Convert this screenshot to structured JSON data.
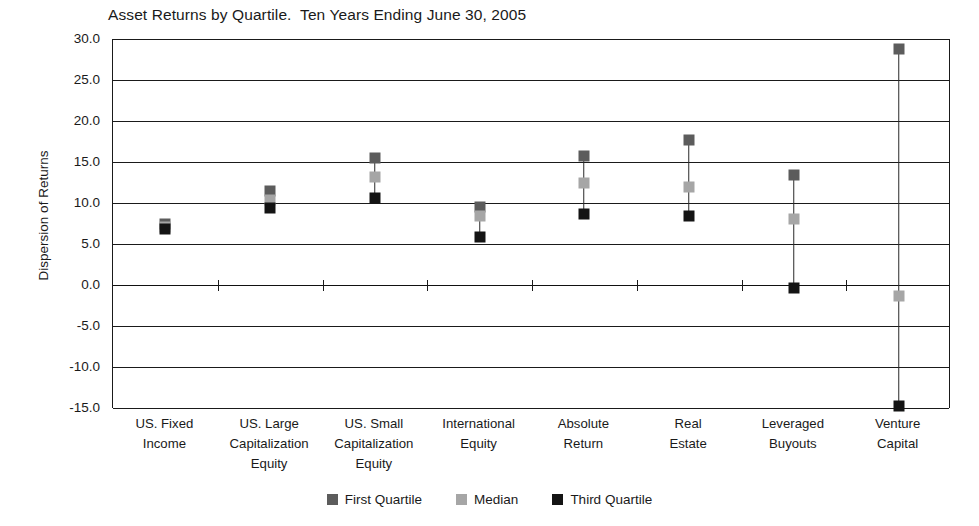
{
  "chart_data": {
    "type": "scatter",
    "title": "Asset Returns by Quartile.  Ten Years Ending June 30, 2005",
    "xlabel": "",
    "ylabel": "Dispersion of Returns",
    "ylim": [
      -15.0,
      30.0
    ],
    "ytick_step": 5.0,
    "ytick_labels": [
      "30.0",
      "25.0",
      "20.0",
      "15.0",
      "10.0",
      "5.0",
      "0.0",
      "-5.0",
      "-10.0",
      "-15.0"
    ],
    "ytick_values": [
      30.0,
      25.0,
      20.0,
      15.0,
      10.0,
      5.0,
      0.0,
      -5.0,
      -10.0,
      -15.0
    ],
    "grid": true,
    "legend_position": "bottom",
    "categories": [
      "US. Fixed\nIncome",
      "US. Large\nCapitalization\nEquity",
      "US. Small\nCapitalization\nEquity",
      "International\nEquity",
      "Absolute\nReturn",
      "Real\nEstate",
      "Leveraged\nBuyouts",
      "Venture\nCapital"
    ],
    "series": [
      {
        "name": "First Quartile",
        "color": "#5c5c5c",
        "values": [
          7.4,
          11.5,
          15.5,
          9.5,
          15.7,
          17.7,
          13.4,
          28.8
        ]
      },
      {
        "name": "Median",
        "color": "#a6a6a6",
        "values": [
          7.1,
          10.4,
          13.2,
          8.4,
          12.5,
          12.0,
          8.0,
          -1.4
        ]
      },
      {
        "name": "Third Quartile",
        "color": "#141414",
        "values": [
          6.8,
          9.4,
          10.6,
          5.9,
          8.6,
          8.4,
          -0.4,
          -14.8
        ]
      }
    ]
  },
  "legend": {
    "items": [
      {
        "label": "First Quartile",
        "color": "#5c5c5c"
      },
      {
        "label": "Median",
        "color": "#a6a6a6"
      },
      {
        "label": "Third Quartile",
        "color": "#141414"
      }
    ]
  }
}
